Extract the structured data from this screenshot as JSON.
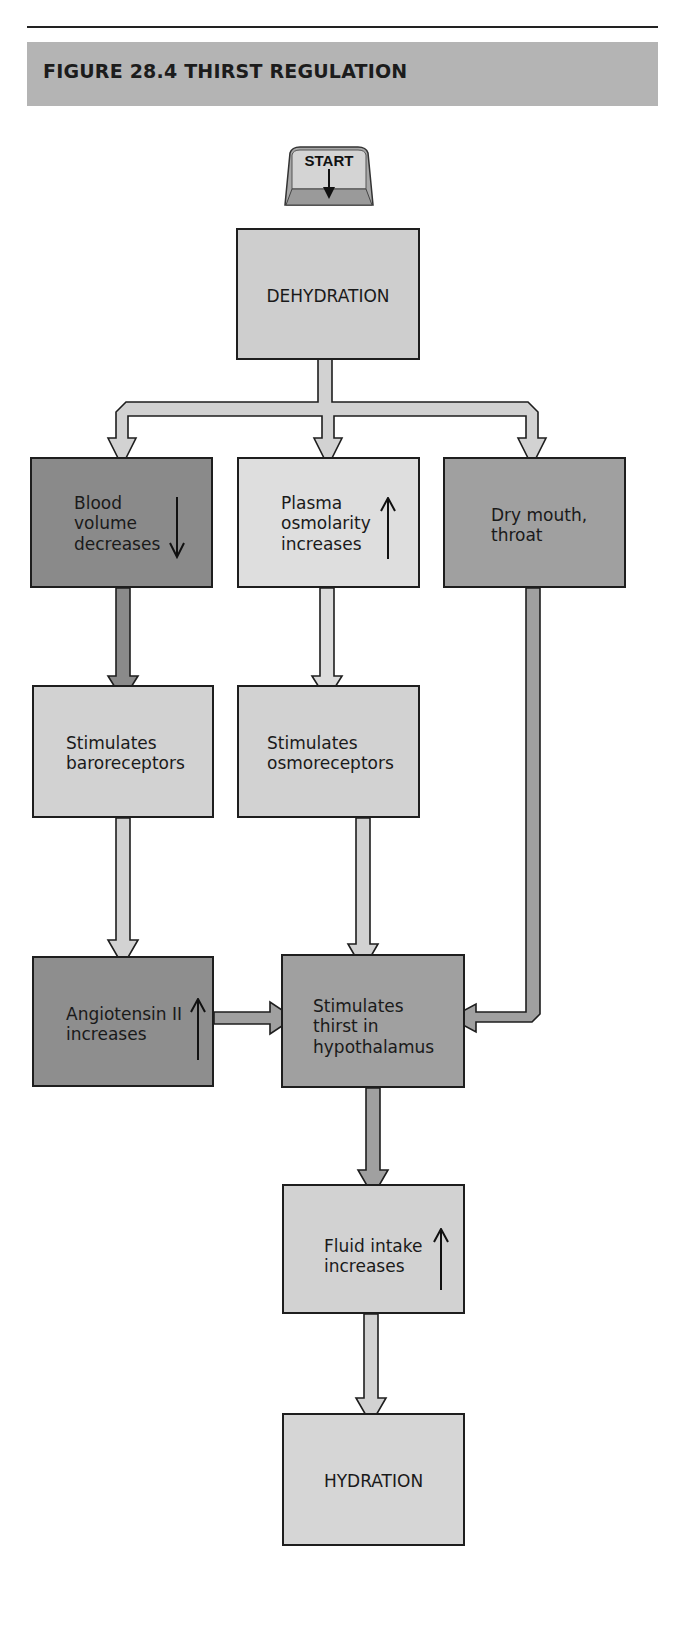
{
  "figure": {
    "title": "FIGURE 28.4  THIRST REGULATION"
  },
  "start_key": {
    "label": "START",
    "icon": "down-arrow-icon"
  },
  "colors": {
    "title_bar": "#b4b4b4",
    "light": "#d2d2d2",
    "lighter": "#dedede",
    "medium": "#a0a0a0",
    "dark": "#8a8a8a",
    "border": "#1e1e1e"
  },
  "nodes": {
    "dehydration": {
      "text": "DEHYDRATION"
    },
    "blood_volume": {
      "text": "Blood\nvolume\ndecreases",
      "indicator": "down"
    },
    "plasma_osmolarity": {
      "text": "Plasma\nosmolarity\nincreases",
      "indicator": "up"
    },
    "dry_mouth": {
      "text": "Dry mouth,\nthroat"
    },
    "baroreceptors": {
      "text": "Stimulates\nbaroreceptors"
    },
    "osmoreceptors": {
      "text": "Stimulates\nosmoreceptors"
    },
    "angiotensin": {
      "text": "Angiotensin II\nincreases",
      "indicator": "up"
    },
    "hypothalamus": {
      "text": "Stimulates\nthirst in\nhypothalamus"
    },
    "fluid_intake": {
      "text": "Fluid intake\nincreases",
      "indicator": "up"
    },
    "hydration": {
      "text": "HYDRATION"
    }
  },
  "edges": [
    {
      "from": "start",
      "to": "dehydration"
    },
    {
      "from": "dehydration",
      "to": "blood_volume"
    },
    {
      "from": "dehydration",
      "to": "plasma_osmolarity"
    },
    {
      "from": "dehydration",
      "to": "dry_mouth"
    },
    {
      "from": "blood_volume",
      "to": "baroreceptors"
    },
    {
      "from": "plasma_osmolarity",
      "to": "osmoreceptors"
    },
    {
      "from": "baroreceptors",
      "to": "angiotensin"
    },
    {
      "from": "osmoreceptors",
      "to": "hypothalamus"
    },
    {
      "from": "dry_mouth",
      "to": "hypothalamus"
    },
    {
      "from": "angiotensin",
      "to": "hypothalamus"
    },
    {
      "from": "hypothalamus",
      "to": "fluid_intake"
    },
    {
      "from": "fluid_intake",
      "to": "hydration"
    }
  ]
}
